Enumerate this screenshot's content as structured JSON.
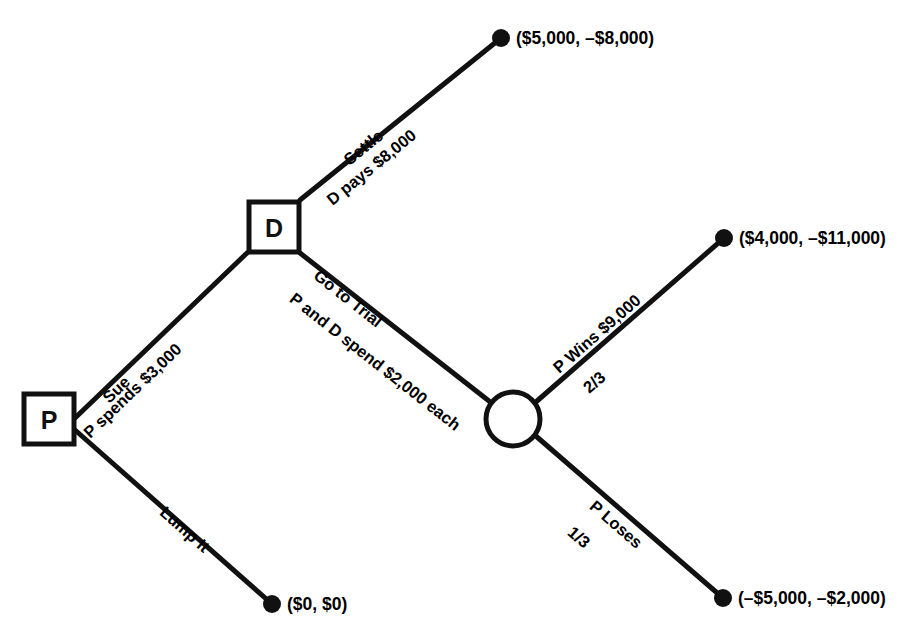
{
  "diagram": {
    "type": "decision-tree",
    "line_color": "#111111",
    "background_color": "#ffffff",
    "nodes": [
      {
        "id": "p-node",
        "kind": "decision-square",
        "label": "P"
      },
      {
        "id": "d-node",
        "kind": "decision-square",
        "label": "D"
      },
      {
        "id": "chance-node",
        "kind": "chance-circle",
        "label": ""
      }
    ],
    "branches": [
      {
        "id": "sue",
        "from": "p-node",
        "to": "d-node",
        "label_top": "Sue",
        "label_bottom": "P spends $3,000"
      },
      {
        "id": "lump-it",
        "from": "p-node",
        "to": "terminal-lump-it",
        "label_top": "Lump It",
        "label_bottom": ""
      },
      {
        "id": "settle",
        "from": "d-node",
        "to": "terminal-settle",
        "label_top": "Settle",
        "label_bottom": "D pays $8,000"
      },
      {
        "id": "go-to-trial",
        "from": "d-node",
        "to": "chance-node",
        "label_top": "Go to Trial",
        "label_bottom": "P and D spend $2,000 each"
      },
      {
        "id": "p-wins",
        "from": "chance-node",
        "to": "terminal-p-wins",
        "label_top": "P Wins $9,000",
        "label_bottom": "2/3",
        "probability": "2/3"
      },
      {
        "id": "p-loses",
        "from": "chance-node",
        "to": "terminal-p-loses",
        "label_top": "P Loses",
        "label_bottom": "1/3",
        "probability": "1/3"
      }
    ],
    "terminals": [
      {
        "id": "terminal-settle",
        "payoff": "($5,000, –$8,000)"
      },
      {
        "id": "terminal-p-wins",
        "payoff": "($4,000, –$11,000)"
      },
      {
        "id": "terminal-p-loses",
        "payoff": "(–$5,000, –$2,000)"
      },
      {
        "id": "terminal-lump-it",
        "payoff": "($0, $0)"
      }
    ]
  }
}
